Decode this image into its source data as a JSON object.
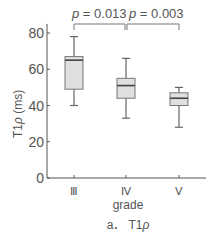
{
  "chart_data": {
    "type": "box",
    "title": "",
    "caption": "a.  T1ρ",
    "xlabel": "grade",
    "ylabel": "T1ρ  (ms)",
    "ylim": [
      0,
      85
    ],
    "yticks": [
      0,
      20,
      40,
      60,
      80
    ],
    "grid": false,
    "categories": [
      "Ⅲ",
      "Ⅳ",
      "Ⅴ"
    ],
    "boxes": [
      {
        "category": "Ⅲ",
        "whisker_low": 40,
        "q1": 49,
        "median": 65,
        "q3": 67,
        "whisker_high": 78
      },
      {
        "category": "Ⅳ",
        "whisker_low": 33,
        "q1": 44,
        "median": 51,
        "q3": 55,
        "whisker_high": 66
      },
      {
        "category": "Ⅴ",
        "whisker_low": 28,
        "q1": 40,
        "median": 44,
        "q3": 47,
        "whisker_high": 50
      }
    ],
    "annotations": [
      {
        "text": "p = 0.013",
        "from": "Ⅲ",
        "to": "Ⅳ"
      },
      {
        "text": "p = 0.003",
        "from": "Ⅳ",
        "to": "Ⅴ"
      }
    ],
    "colors": {
      "box_fill": "#e0e0e0",
      "box_edge": "#777777",
      "median": "#444444",
      "axis": "#555555"
    }
  },
  "labels": {
    "p1_italic": "p",
    "p1_value": " = 0.013",
    "p2_italic": "p",
    "p2_value": " = 0.003",
    "ylabel_main": "T1",
    "ylabel_rho": "ρ",
    "ylabel_unit": "  (ms)",
    "caption_prefix": "a．  T1",
    "caption_rho": "ρ"
  }
}
